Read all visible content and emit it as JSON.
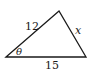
{
  "diagram": {
    "type": "triangle",
    "vertices": {
      "left": [
        6,
        57
      ],
      "top": [
        59,
        11
      ],
      "right": [
        86,
        57
      ]
    },
    "sides": {
      "left_top": "12",
      "top_right": "x",
      "bottom": "15"
    },
    "angle_label": "θ",
    "stroke_color": "#1a1a1a"
  }
}
